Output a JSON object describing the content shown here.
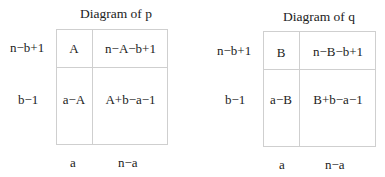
{
  "diagrams": [
    {
      "title": "Diagram of p",
      "row_labels": [
        "n−b+1",
        "b−1"
      ],
      "col_labels": [
        "a",
        "n−a"
      ],
      "cells": [
        [
          "A",
          "n−A−b+1"
        ],
        [
          "a−A",
          "A+b−a−1"
        ]
      ]
    },
    {
      "title": "Diagram of q",
      "row_labels": [
        "n−b+1",
        "b−1"
      ],
      "col_labels": [
        "a",
        "n−a"
      ],
      "cells": [
        [
          "B",
          "n−B−b+1"
        ],
        [
          "a−B",
          "B+b−a−1"
        ]
      ]
    }
  ]
}
